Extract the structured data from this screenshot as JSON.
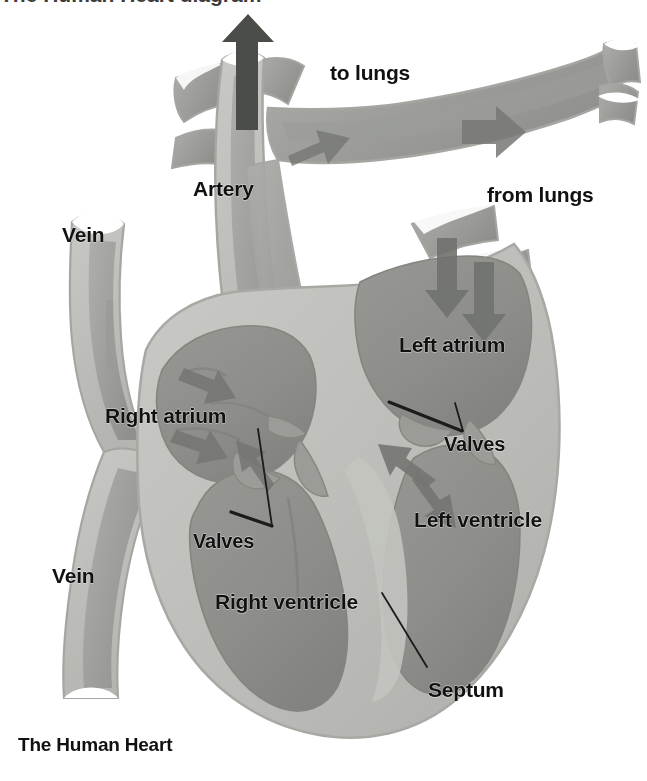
{
  "figure": {
    "title": "The Human Heart",
    "kind": "anatomical-cross-section-diagram",
    "subject": "human heart",
    "background_color": "#ffffff"
  },
  "palette": {
    "muscle_wall": "#b9bab5",
    "muscle_wall_light": "#c7c8c3",
    "chamber_dark": "#8e8f8b",
    "vessel_mid": "#a2a3a0",
    "vessel_dark": "#8a8b87",
    "outline": "#9d9e99",
    "arrow_gray": "#6e6f6b",
    "text": "#111111",
    "leader_line": "#1a1a1a"
  },
  "labels": [
    {
      "id": "to-lungs",
      "text": "to lungs",
      "x": 330,
      "y": 62,
      "size": "sz-lg"
    },
    {
      "id": "artery",
      "text": "Artery",
      "x": 193,
      "y": 178,
      "size": "sz-lg"
    },
    {
      "id": "from-lungs",
      "text": "from lungs",
      "x": 487,
      "y": 184,
      "size": "sz-lg"
    },
    {
      "id": "vein-upper",
      "text": "Vein",
      "x": 62,
      "y": 224,
      "size": "sz-lg"
    },
    {
      "id": "left-atrium",
      "text": "Left atrium",
      "x": 399,
      "y": 334,
      "size": "sz-lg"
    },
    {
      "id": "right-atrium",
      "text": "Right atrium",
      "x": 105,
      "y": 405,
      "size": "sz-lg"
    },
    {
      "id": "valves-right",
      "text": "Valves",
      "x": 444,
      "y": 434,
      "size": "sz-md"
    },
    {
      "id": "valves-left",
      "text": "Valves",
      "x": 193,
      "y": 531,
      "size": "sz-md"
    },
    {
      "id": "left-ventricle",
      "text": "Left ventricle",
      "x": 414,
      "y": 509,
      "size": "sz-lg"
    },
    {
      "id": "vein-lower",
      "text": "Vein",
      "x": 52,
      "y": 565,
      "size": "sz-lg"
    },
    {
      "id": "right-ventricle",
      "text": "Right ventricle",
      "x": 215,
      "y": 591,
      "size": "sz-lg"
    },
    {
      "id": "septum",
      "text": "Septum",
      "x": 428,
      "y": 679,
      "size": "sz-lg"
    },
    {
      "id": "figure-title",
      "text": "The Human Heart",
      "x": 18,
      "y": 735,
      "size": "title"
    }
  ],
  "cutoff_header": {
    "text": "The Human Heart diagram",
    "note": "partially cropped text row at very top edge"
  },
  "annotations": {
    "leader_lines": [
      {
        "id": "valves-right-leader",
        "from_label": "valves-right",
        "points": "390,402 463,432"
      },
      {
        "id": "valves-right-leader-2",
        "from_label": "valves-right",
        "points": "464,432 455,404"
      },
      {
        "id": "valves-left-leader",
        "from_label": "valves-left",
        "points": "271,525 232,513"
      },
      {
        "id": "valves-left-leader-2",
        "from_label": "valves-left",
        "points": "272,526 258,430"
      },
      {
        "id": "septum-leader",
        "from_label": "septum",
        "points": "427,668 383,594"
      }
    ],
    "flow_arrows": [
      {
        "id": "arrow-aorta-up",
        "direction": "up",
        "vessel": "artery"
      },
      {
        "id": "arrow-pulm-trunk-up",
        "direction": "up-right",
        "vessel": "to lungs"
      },
      {
        "id": "arrow-to-lungs-right",
        "direction": "right",
        "vessel": "to lungs"
      },
      {
        "id": "arrow-from-lungs-down",
        "direction": "down",
        "vessel": "from lungs"
      },
      {
        "id": "arrow-from-lungs-down2",
        "direction": "down-left",
        "vessel": "from lungs"
      },
      {
        "id": "arrow-ra-in",
        "direction": "down-right",
        "vessel": "right atrium"
      },
      {
        "id": "arrow-ra-down",
        "direction": "down",
        "vessel": "right atrium"
      },
      {
        "id": "arrow-lv-up",
        "direction": "up-left",
        "vessel": "left ventricle"
      },
      {
        "id": "arrow-lv-down",
        "direction": "down-right",
        "vessel": "left ventricle"
      },
      {
        "id": "arrow-rv-out",
        "direction": "up-left",
        "vessel": "right ventricle"
      }
    ]
  }
}
